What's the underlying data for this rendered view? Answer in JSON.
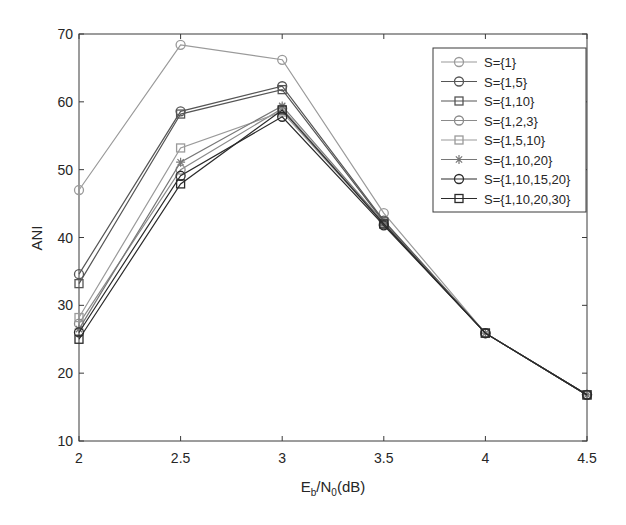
{
  "chart_data": {
    "type": "line",
    "title": "",
    "xlabel": "E_b/N_0(dB)",
    "xlabel_parts": {
      "E": "E",
      "b": "b",
      "slash": "/N",
      "zero": "0",
      "unit": "(dB)"
    },
    "ylabel": "ANI",
    "xlim": [
      2,
      4.5
    ],
    "ylim": [
      10,
      70
    ],
    "xticks": [
      2,
      2.5,
      3,
      3.5,
      4,
      4.5
    ],
    "xtick_labels": [
      "2",
      "2.5",
      "3",
      "3.5",
      "4",
      "4.5"
    ],
    "yticks": [
      10,
      20,
      30,
      40,
      50,
      60,
      70
    ],
    "ytick_labels": [
      "10",
      "20",
      "30",
      "40",
      "50",
      "60",
      "70"
    ],
    "grid": false,
    "legend_position": "top-right",
    "x": [
      2,
      2.5,
      3,
      3.5,
      4,
      4.5
    ],
    "series": [
      {
        "name": "S={1}",
        "marker": "circle",
        "color": "#9a9a9a",
        "values": [
          47.0,
          68.4,
          66.2,
          43.6,
          25.9,
          16.8
        ]
      },
      {
        "name": "S={1,5}",
        "marker": "circle",
        "color": "#555555",
        "values": [
          34.6,
          58.6,
          62.3,
          42.5,
          25.9,
          16.8
        ]
      },
      {
        "name": "S={1,10}",
        "marker": "square",
        "color": "#555555",
        "values": [
          33.2,
          58.2,
          61.8,
          42.3,
          25.9,
          16.8
        ]
      },
      {
        "name": "S={1,2,3}",
        "marker": "circle",
        "color": "#8a8a8a",
        "values": [
          27.3,
          50.0,
          59.0,
          42.0,
          25.9,
          16.8
        ]
      },
      {
        "name": "S={1,5,10}",
        "marker": "square",
        "color": "#9a9a9a",
        "values": [
          28.2,
          53.2,
          58.5,
          42.0,
          25.9,
          16.8
        ]
      },
      {
        "name": "S={1,10,20}",
        "marker": "star",
        "color": "#777777",
        "values": [
          26.5,
          51.1,
          59.4,
          42.2,
          25.9,
          16.8
        ]
      },
      {
        "name": "S={1,10,15,20}",
        "marker": "circle",
        "color": "#2a2a2a",
        "values": [
          26.0,
          49.1,
          57.8,
          41.8,
          25.9,
          16.8
        ]
      },
      {
        "name": "S={1,10,20,30}",
        "marker": "square",
        "color": "#2a2a2a",
        "values": [
          25.0,
          47.9,
          58.8,
          42.0,
          25.9,
          16.8
        ]
      }
    ]
  }
}
